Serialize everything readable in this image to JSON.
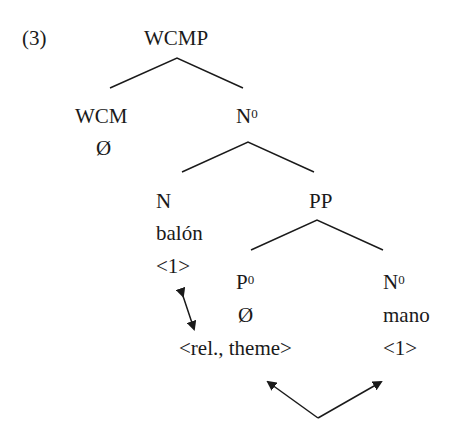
{
  "example_number": "(3)",
  "tree": {
    "root": "WCMP",
    "wcm": {
      "label": "WCM",
      "content": "Ø"
    },
    "n0": {
      "label": "N",
      "sup": "0"
    },
    "n": {
      "label": "N",
      "word": "balón",
      "index": "<1>"
    },
    "pp": {
      "label": "PP"
    },
    "p0": {
      "label": "P",
      "sup": "0",
      "content": "Ø",
      "features": "<rel., theme>"
    },
    "n0_mano": {
      "label": "N",
      "sup": "0",
      "word": "mano",
      "index": "<1>"
    }
  },
  "colors": {
    "text": "#1a1a1a",
    "line": "#1a1a1a"
  }
}
